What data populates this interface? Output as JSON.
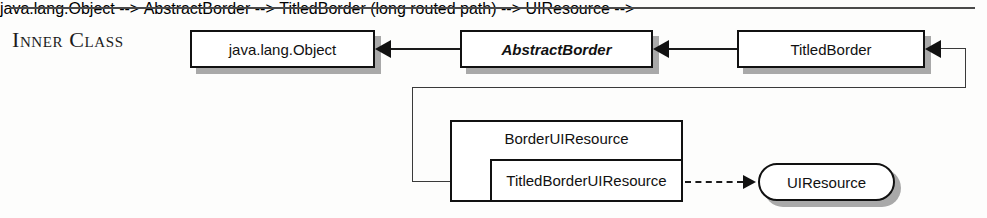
{
  "section": {
    "title": "Inner Class"
  },
  "diagram": {
    "type": "uml-class-hierarchy",
    "nodes": [
      {
        "id": "object",
        "label": "java.lang.Object",
        "kind": "class",
        "style": "normal"
      },
      {
        "id": "abstract_border",
        "label": "AbstractBorder",
        "kind": "class",
        "style": "italic"
      },
      {
        "id": "titled_border",
        "label": "TitledBorder",
        "kind": "class",
        "style": "normal"
      },
      {
        "id": "border_ui_resource",
        "label": "BorderUIResource",
        "kind": "class",
        "style": "normal"
      },
      {
        "id": "titled_border_ui_res",
        "label": "TitledBorderUIResource",
        "kind": "inner-class",
        "style": "normal"
      },
      {
        "id": "ui_resource",
        "label": "UIResource",
        "kind": "interface",
        "style": "normal"
      }
    ],
    "edges": [
      {
        "from": "abstract_border",
        "to": "object",
        "type": "extends"
      },
      {
        "from": "titled_border",
        "to": "abstract_border",
        "type": "extends"
      },
      {
        "from": "titled_border_ui_res",
        "to": "titled_border",
        "type": "extends"
      },
      {
        "from": "titled_border_ui_res",
        "to": "ui_resource",
        "type": "implements"
      }
    ]
  }
}
